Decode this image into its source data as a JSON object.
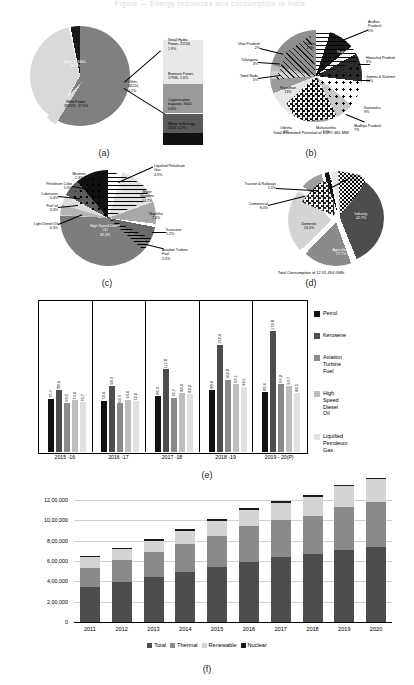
{
  "faint_title": "Figure — Energy resources and consumption in India",
  "captions": {
    "a": "(a)",
    "b": "(b)",
    "c": "(c)",
    "d": "(d)",
    "e": "(e)",
    "f": "(f)"
  },
  "colors": {
    "solar": "#808080",
    "wind": "#d9d9d9",
    "other_dark": "#1a1a1a",
    "light": "#e8e8e8",
    "mid": "#9a9a9a",
    "dark": "#4d4d4d",
    "black": "#111111",
    "industry": "#4d4d4d",
    "domestic": "#d4d4d4",
    "agriculture": "#8a8a8a",
    "grid": "#d0d0d0"
  },
  "chart_data": [
    {
      "id": "a",
      "type": "pie",
      "title": "Renewable energy installed capacity",
      "categories": [
        "Solar",
        "Wind Power",
        "Other"
      ],
      "values": [
        58.2,
        37.6,
        4.2
      ],
      "labels": [
        "Solar, 748460,\n58.2%",
        "Wind Power,\n392291, 37.6%",
        "Other,\n46224,\n4.2%"
      ],
      "breakout": {
        "title": "Other (exploded bar)",
        "categories": [
          "Small Hydro Power",
          "Biomass Power",
          "Cogeneration-bagasse",
          "Waste to Energy"
        ],
        "values": [
          1.9,
          1.6,
          0.8,
          0.2
        ],
        "labels": [
          "Small Hydro\nPower, 21134,\n1.9%",
          "Biomass Power,\n17936, 1.6%",
          "Cogeneration-\nbagasse, 9000,\n0.8%",
          "Waste to Energy,\n2554, 0.2%"
        ]
      }
    },
    {
      "id": "b",
      "type": "pie",
      "title": "State-wise estimated renewable potential",
      "categories": [
        "Andhra Pradesh",
        "Gujarat",
        "Himachal Pradesh",
        "Jammu & Kashmir",
        "Karnataka",
        "Madhya Pradesh",
        "Maharashtra",
        "Odisha",
        "Rajasthan",
        "Tamil Nadu",
        "Telangana",
        "Uttar Pradesh",
        "Others"
      ],
      "values": [
        5,
        9,
        3,
        10,
        9,
        7,
        10,
        3,
        13,
        5,
        3,
        2,
        19
      ],
      "labels": [
        "Andhra\nPradesh\n5%",
        "Gujarat\n9%",
        "Himachal Pradesh\n3%",
        "Jammu & Kashmir\n10%",
        "Karnataka\n9%",
        "Madhya Pradesh\n7%",
        "Maharashtra\n10%",
        "Odisha\n3%",
        "Rajasthan\n13%",
        "Tamil Nadu\n5%",
        "Telangana\n3%",
        "Uttar Pradesh\n2%",
        "Others\n19%"
      ],
      "note": "Total Estimated Potential of 1,097,465 MW"
    },
    {
      "id": "c",
      "type": "pie",
      "title": "Petroleum product consumption share",
      "categories": [
        "High Speed Diesel Oil",
        "Motor Gasoline",
        "Naphtha",
        "Liquified Petroleum Gas",
        "Aviation Turbine Fuel",
        "Petroleum Coke",
        "Fuel oil",
        "Bitumen",
        "Kerosene",
        "Lubricants",
        "Light Diesel Oil",
        "Others"
      ],
      "values": [
        42.3,
        14.7,
        7.4,
        4.9,
        5.6,
        5.9,
        3.3,
        2.3,
        1.2,
        0.4,
        0.3,
        11.5
      ],
      "labels": [
        "High Speed Diesel\nOil\n42.3%",
        "Motor\nGasoline\n14.7%",
        "Naphtha\n7.4%",
        "Liquified Petroleum\nGas\n4.9%",
        "Aviation Turbine\nFuel\n5.6%",
        "Petroleum Coke\n5.9%",
        "Fuel oil\n3.3%",
        "Bitumen\n2.3%",
        "Kerosene\n1.2%",
        "Lubricants\n0.4%",
        "Light Diesel Oil\n0.3%",
        "Others\n11.5%"
      ]
    },
    {
      "id": "d",
      "type": "pie",
      "title": "Electricity consumption by sector",
      "categories": [
        "Industry",
        "Domestic",
        "Agriculture",
        "Commercial",
        "Traction & Railways",
        "Others"
      ],
      "values": [
        42.7,
        24.0,
        17.7,
        8.0,
        1.5,
        6.1
      ],
      "labels": [
        "Industry\n42.7%",
        "Domestic\n24.0%",
        "Agriculture\n17.7%",
        "Commercial\n8.0%",
        "Traction & Railways\n1.5%",
        "Others\n6.1%"
      ],
      "note": "Total Consumption of 12,91,494 GWh"
    },
    {
      "id": "e",
      "type": "bar",
      "title": "Consumption of petroleum products (index)",
      "categories": [
        "2015 -16",
        "2016 -17",
        "2017 -18",
        "2018 -19",
        "2019 - 20(P)"
      ],
      "series": [
        {
          "name": "Petrol",
          "values": [
            75.7,
            72.4,
            80.3,
            88.4,
            85.6
          ],
          "color": "#111111"
        },
        {
          "name": "Kerosene",
          "values": [
            88.4,
            94.3,
            117.8,
            152.4,
            172.8
          ],
          "color": "#4d4d4d"
        },
        {
          "name": "Aviation Turbine Fuel",
          "values": [
            69.5,
            69.3,
            76.7,
            102.8,
            97.2
          ],
          "color": "#8a8a8a"
        },
        {
          "name": "High Speed Diesel Oil",
          "values": [
            73.4,
            74.4,
            84.4,
            97.1,
            93.7
          ],
          "color": "#bdbdbd"
        },
        {
          "name": "Liquified Petroleum Gas",
          "values": [
            70.7,
            72.0,
            82.2,
            92.1,
            84.5
          ],
          "color": "#e0e0e0"
        }
      ],
      "ylim": [
        0,
        185
      ],
      "grid": false,
      "legend_position": "right"
    },
    {
      "id": "f",
      "type": "bar-stacked",
      "title": "Installed generation capacity (MW)",
      "categories": [
        "2011",
        "2012",
        "2013",
        "2014",
        "2015",
        "2016",
        "2017",
        "2018",
        "2019",
        "2020"
      ],
      "yticks": [
        "0",
        "2,00,000",
        "4,00,000",
        "6,00,000",
        "8,00,000",
        "10,00,000",
        "12,00,000"
      ],
      "ylim": [
        0,
        1200000
      ],
      "series": [
        {
          "name": "Total",
          "values": [
            345000,
            390000,
            440000,
            490000,
            540000,
            595000,
            635000,
            665000,
            710000,
            740000
          ],
          "color": "#4d4d4d"
        },
        {
          "name": "Thermal",
          "values": [
            190000,
            220000,
            250000,
            280000,
            310000,
            345000,
            365000,
            380000,
            425000,
            440000
          ],
          "color": "#8a8a8a"
        },
        {
          "name": "Renewable",
          "values": [
            100000,
            105000,
            110000,
            130000,
            145000,
            165000,
            175000,
            185000,
            200000,
            225000
          ],
          "color": "#d4d4d4"
        },
        {
          "name": "Nuclear",
          "values": [
            15000,
            15000,
            15000,
            15000,
            15000,
            15000,
            15000,
            15000,
            15000,
            15000
          ],
          "color": "#1a1a1a"
        }
      ],
      "stack_order": [
        "Total",
        "Thermal",
        "Renewable",
        "Nuclear"
      ],
      "grid": true,
      "legend_position": "bottom"
    }
  ]
}
